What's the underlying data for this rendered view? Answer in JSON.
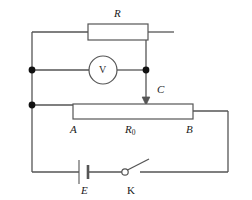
{
  "diagram": {
    "type": "electrical-circuit-schematic",
    "stroke_color": "#555555",
    "fill_color": "#ffffff",
    "label_color": "#1a1a1a",
    "background": "#ffffff"
  },
  "components": {
    "resistor": {
      "label": "R",
      "name": "fixed resistor",
      "x": 88,
      "y": 34,
      "width": 60,
      "height": 16
    },
    "voltmeter": {
      "label": "V",
      "name": "voltmeter",
      "cx": 103,
      "cy": 70,
      "r": 14
    },
    "rheostat": {
      "label": "R0",
      "label_base": "R",
      "label_sub": "0",
      "name": "slide rheostat / potentiometer",
      "terminal_left": "A",
      "terminal_right": "B",
      "x": 73,
      "y": 104,
      "width": 120,
      "height": 15
    },
    "slider": {
      "label": "C",
      "name": "sliding contact tap",
      "x": 146,
      "y_top": 70,
      "y_bottom": 104
    },
    "battery": {
      "label": "E",
      "name": "cell / EMF source",
      "x": 84,
      "y": 172
    },
    "switch": {
      "label": "K",
      "name": "open knife switch",
      "x": 130,
      "y": 172,
      "state": "open"
    }
  },
  "nodes": {
    "junction_upper_left": {
      "x": 32,
      "y": 70
    },
    "junction_lower_left": {
      "x": 32,
      "y": 105
    },
    "junction_right": {
      "x": 146,
      "y": 70
    }
  },
  "labels": {
    "R": "R",
    "V": "V",
    "C": "C",
    "A": "A",
    "B": "B",
    "R0_base": "R",
    "R0_sub": "0",
    "E": "E",
    "K": "K"
  }
}
